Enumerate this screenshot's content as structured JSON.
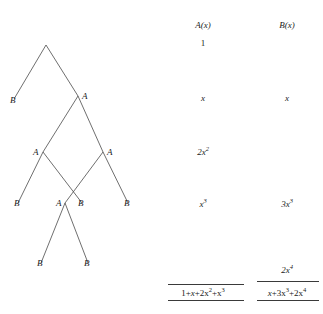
{
  "tree": {
    "nodes": [
      {
        "id": "root",
        "label": "",
        "x": 46,
        "y": 45,
        "lx": 0,
        "ly": 0
      },
      {
        "id": "n-b1",
        "label": "B",
        "x": 14,
        "y": 99,
        "lx": 10,
        "ly": 96
      },
      {
        "id": "n-a1",
        "label": "A",
        "x": 78,
        "y": 96,
        "lx": 82,
        "ly": 92
      },
      {
        "id": "n-a2",
        "label": "A",
        "x": 43,
        "y": 152,
        "lx": 33,
        "ly": 148
      },
      {
        "id": "n-a3",
        "label": "A",
        "x": 103,
        "y": 152,
        "lx": 107,
        "ly": 148
      },
      {
        "id": "n-b2",
        "label": "B",
        "x": 18,
        "y": 203,
        "lx": 14,
        "ly": 199
      },
      {
        "id": "n-a4",
        "label": "A",
        "x": 65,
        "y": 203,
        "lx": 56,
        "ly": 199
      },
      {
        "id": "n-b3",
        "label": "B",
        "x": 82,
        "y": 203,
        "lx": 78,
        "ly": 199
      },
      {
        "id": "n-b4",
        "label": "B",
        "x": 128,
        "y": 203,
        "lx": 124,
        "ly": 199
      },
      {
        "id": "n-b5",
        "label": "B",
        "x": 41,
        "y": 263,
        "lx": 37,
        "ly": 259
      },
      {
        "id": "n-b6",
        "label": "B",
        "x": 88,
        "y": 263,
        "lx": 84,
        "ly": 259
      }
    ],
    "edges": [
      {
        "from": "root",
        "to": "n-b1"
      },
      {
        "from": "root",
        "to": "n-a1"
      },
      {
        "from": "n-a1",
        "to": "n-a2"
      },
      {
        "from": "n-a1",
        "to": "n-a3"
      },
      {
        "from": "n-a2",
        "to": "n-b2"
      },
      {
        "from": "n-a2",
        "to": "n-b3"
      },
      {
        "from": "n-a3",
        "to": "n-a4"
      },
      {
        "from": "n-a3",
        "to": "n-b4"
      },
      {
        "from": "n-a4",
        "to": "n-b5"
      },
      {
        "from": "n-a4",
        "to": "n-b6"
      }
    ]
  },
  "columns": {
    "a": {
      "header": "A(x)",
      "header_x": 203,
      "header_y": 20,
      "center_x": 203,
      "terms": [
        {
          "y": 38,
          "text": "1",
          "italic": false
        },
        {
          "y": 93,
          "text": "x",
          "italic": true
        },
        {
          "y": 147,
          "text": "2x2",
          "italic": true
        },
        {
          "y": 199,
          "text": "x3",
          "italic": true
        }
      ],
      "sum": {
        "text": "1+x+2x2+x3",
        "y": 288,
        "rule_top_y": 284,
        "rule_bottom_y": 300,
        "rule_left": 168,
        "rule_width": 76
      }
    },
    "b": {
      "header": "B(x)",
      "header_x": 287,
      "header_y": 20,
      "center_x": 287,
      "terms": [
        {
          "y": 93,
          "text": "x",
          "italic": true
        },
        {
          "y": 199,
          "text": "3x3",
          "italic": true
        }
      ],
      "extra_term": {
        "text": "2x4",
        "y": 265
      },
      "sum": {
        "text": "x+3x3+2x4",
        "y": 288,
        "rule_top_y": 281,
        "rule_bottom_y": 300,
        "rule_left": 257,
        "rule_width": 62
      }
    }
  }
}
